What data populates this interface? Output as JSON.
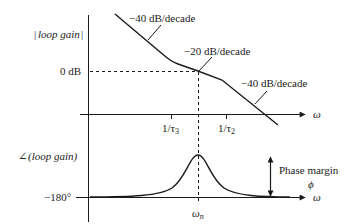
{
  "figure": {
    "colors": {
      "ink": "#1a1a1a",
      "background": "#ffffff"
    }
  },
  "magnitude_plot": {
    "ylabel": "|loop gain|",
    "zero_db_label": "0 dB",
    "xaxis_label": "ω",
    "slopes": [
      {
        "label": "−40 dB/decade"
      },
      {
        "label": "−20 dB/decade"
      },
      {
        "label": "−40 dB/decade"
      }
    ],
    "ticks": [
      {
        "label": "1/τ",
        "sub": "3"
      },
      {
        "label": "1/τ",
        "sub": "2"
      }
    ]
  },
  "phase_plot": {
    "ylabel": "∠(loop gain)",
    "baseline_label": "−180°",
    "xaxis_label": "ω",
    "peak_label": "ω",
    "peak_sub": "n",
    "margin_label": "Phase margin",
    "margin_symbol": "ϕ"
  }
}
